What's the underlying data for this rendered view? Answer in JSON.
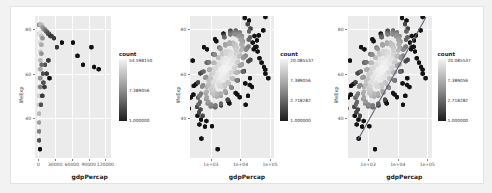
{
  "figure": {
    "background": "#f2f2f2",
    "panel_background": "#ebebeb",
    "grid_color": "#ffffff",
    "regression_line_color": "#5a5a6e"
  },
  "chart_data": [
    {
      "type": "heatmap",
      "subtype": "hexbin",
      "title": "",
      "xlabel": "gdpPercap",
      "ylabel": "lifeExp",
      "xscale": "linear",
      "yscale": "linear",
      "xticks": [
        "0",
        "30000",
        "60000",
        "90000",
        "120000"
      ],
      "xtick_values": [
        0,
        30000,
        60000,
        90000,
        120000
      ],
      "yticks": [
        "80",
        "60",
        "40"
      ],
      "ytick_values": [
        80,
        60,
        40
      ],
      "xlim": [
        -6000,
        130000
      ],
      "ylim": [
        22,
        86
      ],
      "grid": true,
      "legend": {
        "title": "count",
        "position": "right",
        "scale": "log",
        "labels": [
          "54.598150",
          "7.389056",
          "1.000000"
        ],
        "values": [
          54.59815,
          7.389056,
          1.0
        ],
        "gradient_low": "#1c1c1c",
        "gradient_high": "#f4f4f4"
      },
      "bins": [
        {
          "x": 1500,
          "y": 82,
          "count": 8
        },
        {
          "x": 3500,
          "y": 82,
          "count": 14
        },
        {
          "x": 5500,
          "y": 82,
          "count": 20
        },
        {
          "x": 7500,
          "y": 81,
          "count": 12
        },
        {
          "x": 9500,
          "y": 80,
          "count": 9
        },
        {
          "x": 11500,
          "y": 80,
          "count": 7
        },
        {
          "x": 13500,
          "y": 79,
          "count": 5
        },
        {
          "x": 15500,
          "y": 79,
          "count": 4
        },
        {
          "x": 17500,
          "y": 78,
          "count": 3
        },
        {
          "x": 19500,
          "y": 78,
          "count": 3
        },
        {
          "x": 21500,
          "y": 77,
          "count": 2
        },
        {
          "x": 23500,
          "y": 77,
          "count": 2
        },
        {
          "x": 1500,
          "y": 78,
          "count": 30
        },
        {
          "x": 3500,
          "y": 78,
          "count": 40
        },
        {
          "x": 5500,
          "y": 77,
          "count": 22
        },
        {
          "x": 7500,
          "y": 76,
          "count": 10
        },
        {
          "x": 1500,
          "y": 74,
          "count": 48
        },
        {
          "x": 3500,
          "y": 74,
          "count": 35
        },
        {
          "x": 5500,
          "y": 73,
          "count": 15
        },
        {
          "x": 1500,
          "y": 70,
          "count": 54
        },
        {
          "x": 3500,
          "y": 70,
          "count": 28
        },
        {
          "x": 5500,
          "y": 69,
          "count": 10
        },
        {
          "x": 1500,
          "y": 66,
          "count": 50
        },
        {
          "x": 3500,
          "y": 66,
          "count": 20
        },
        {
          "x": 1500,
          "y": 62,
          "count": 44
        },
        {
          "x": 3500,
          "y": 62,
          "count": 14
        },
        {
          "x": 1500,
          "y": 58,
          "count": 38
        },
        {
          "x": 3500,
          "y": 58,
          "count": 10
        },
        {
          "x": 1500,
          "y": 54,
          "count": 32
        },
        {
          "x": 3500,
          "y": 54,
          "count": 7
        },
        {
          "x": 1500,
          "y": 50,
          "count": 28
        },
        {
          "x": 1500,
          "y": 46,
          "count": 22
        },
        {
          "x": 1500,
          "y": 42,
          "count": 18
        },
        {
          "x": 1500,
          "y": 38,
          "count": 12
        },
        {
          "x": 1500,
          "y": 34,
          "count": 7
        },
        {
          "x": 1500,
          "y": 30,
          "count": 3
        },
        {
          "x": 3000,
          "y": 26,
          "count": 1
        },
        {
          "x": 28000,
          "y": 76,
          "count": 2
        },
        {
          "x": 33000,
          "y": 72,
          "count": 2
        },
        {
          "x": 42000,
          "y": 74,
          "count": 1
        },
        {
          "x": 62000,
          "y": 74,
          "count": 1
        },
        {
          "x": 70000,
          "y": 68,
          "count": 1
        },
        {
          "x": 80000,
          "y": 64,
          "count": 1
        },
        {
          "x": 95000,
          "y": 72,
          "count": 1
        },
        {
          "x": 100000,
          "y": 63,
          "count": 1
        },
        {
          "x": 108000,
          "y": 62,
          "count": 1
        },
        {
          "x": 12000,
          "y": 64,
          "count": 3
        },
        {
          "x": 15000,
          "y": 60,
          "count": 2
        },
        {
          "x": 18000,
          "y": 66,
          "count": 2
        },
        {
          "x": 20000,
          "y": 58,
          "count": 1
        },
        {
          "x": 9000,
          "y": 56,
          "count": 3
        },
        {
          "x": 11000,
          "y": 54,
          "count": 2
        },
        {
          "x": 7000,
          "y": 50,
          "count": 2
        },
        {
          "x": 5000,
          "y": 46,
          "count": 3
        },
        {
          "x": 8000,
          "y": 60,
          "count": 3
        },
        {
          "x": 6000,
          "y": 64,
          "count": 5
        }
      ]
    },
    {
      "type": "heatmap",
      "subtype": "hexbin",
      "title": "",
      "xlabel": "gdpPercap",
      "ylabel": "lifeExp",
      "xscale": "log10",
      "yscale": "linear",
      "xticks": [
        "1e+03",
        "1e+04",
        "1e+05"
      ],
      "xtick_values": [
        1000,
        10000,
        100000
      ],
      "yticks": [
        "80",
        "60",
        "40"
      ],
      "ytick_values": [
        80,
        60,
        40
      ],
      "xlim": [
        200,
        140000
      ],
      "ylim": [
        22,
        86
      ],
      "grid": true,
      "legend": {
        "title": "count",
        "position": "right",
        "scale": "log",
        "labels": [
          "20.085537",
          "7.389056",
          "2.718282",
          "1.000000"
        ],
        "values": [
          20.085537,
          7.389056,
          2.718282,
          1.0
        ],
        "gradient_low": "#1c1c1c",
        "gradient_high": "#f4f4f4"
      }
    },
    {
      "type": "heatmap",
      "subtype": "hexbin-with-trendline",
      "title": "",
      "xlabel": "gdpPercap",
      "ylabel": "lifeExp",
      "xscale": "log10",
      "yscale": "linear",
      "xticks": [
        "1e+03",
        "1e+04",
        "1e+05"
      ],
      "xtick_values": [
        1000,
        10000,
        100000
      ],
      "yticks": [
        "80",
        "60",
        "40"
      ],
      "ytick_values": [
        80,
        60,
        40
      ],
      "xlim": [
        200,
        140000
      ],
      "ylim": [
        22,
        86
      ],
      "grid": true,
      "trendline": {
        "type": "linear-fit",
        "color": "#5a5a6e"
      },
      "legend": {
        "title": "count",
        "position": "right",
        "scale": "log",
        "labels": [
          "20.085537",
          "7.389056",
          "2.718282",
          "1.000000"
        ],
        "values": [
          20.085537,
          7.389056,
          2.718282,
          1.0
        ],
        "gradient_low": "#1c1c1c",
        "gradient_high": "#f4f4f4"
      }
    }
  ]
}
